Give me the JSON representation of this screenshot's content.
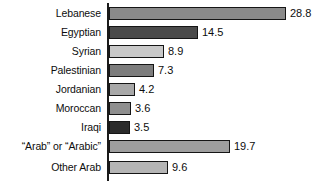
{
  "chart_data": {
    "type": "bar",
    "orientation": "horizontal",
    "title": "",
    "subtitle": "",
    "xlabel": "",
    "ylabel": "",
    "grid": false,
    "legend": false,
    "axis_visible": true,
    "xlim": [
      0,
      28.8
    ],
    "categories": [
      "Lebanese",
      "Egyptian",
      "Syrian",
      "Palestinian",
      "Jordanian",
      "Moroccan",
      "Iraqi",
      "“Arab” or “Arabic”",
      "Other Arab"
    ],
    "values": [
      28.8,
      14.5,
      8.9,
      7.3,
      4.2,
      3.6,
      3.5,
      19.7,
      9.6
    ],
    "value_labels": [
      "28.8",
      "14.5",
      "8.9",
      "7.3",
      "4.2",
      "3.6",
      "3.5",
      "19.7",
      "9.6"
    ],
    "bar_colors": [
      "#8a8a8a",
      "#4a4a4a",
      "#c9c9c9",
      "#7d7d7d",
      "#a8a8a8",
      "#8f8f8f",
      "#2b2b2b",
      "#9e9e9e",
      "#b5b5b5"
    ],
    "axis_color": "#1a1a1a",
    "bar_border_color": "#151515",
    "background_color": "#ffffff",
    "text_color": "#0d0d0d"
  }
}
